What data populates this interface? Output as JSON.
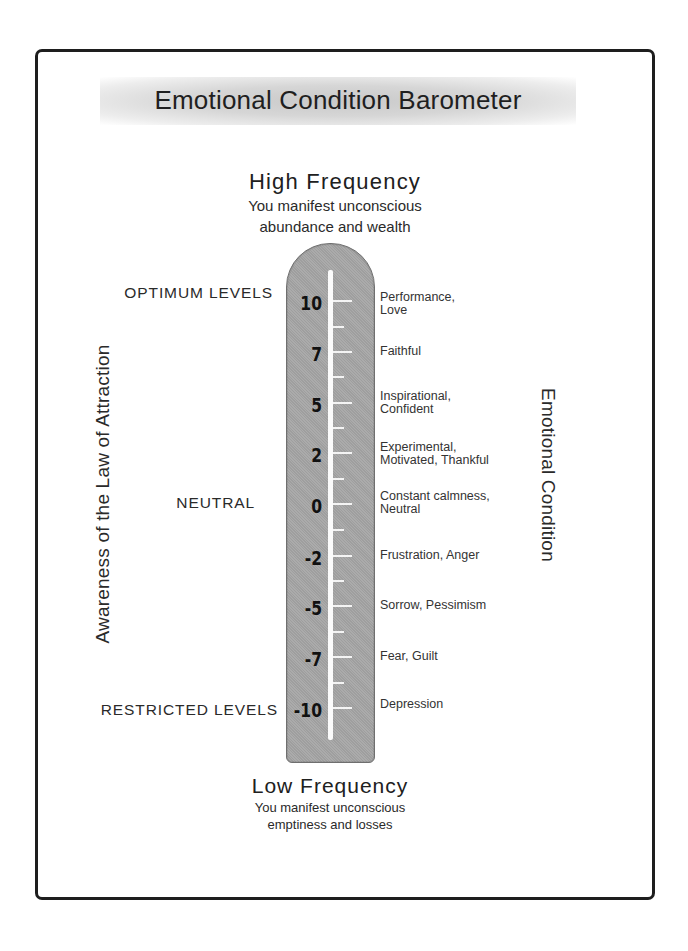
{
  "title": "Emotional Condition Barometer",
  "high": {
    "heading": "High Frequency",
    "line1": "You manifest unconscious",
    "line2": "abundance and wealth"
  },
  "low": {
    "heading": "Low Frequency",
    "line1": "You manifest unconscious",
    "line2": "emptiness and losses"
  },
  "left_axis_label": "Awareness of the Law of Attraction",
  "right_axis_label": "Emotional Condition",
  "zones": {
    "optimum": "OPTIMUM LEVELS",
    "neutral": "NEUTRAL",
    "restricted": "RESTRICTED LEVELS"
  },
  "levels": [
    {
      "value": "10",
      "line1": "Performance,",
      "line2": "Love"
    },
    {
      "value": "7",
      "line1": "Faithful",
      "line2": ""
    },
    {
      "value": "5",
      "line1": "Inspirational,",
      "line2": "Confident"
    },
    {
      "value": "2",
      "line1": "Experimental,",
      "line2": "Motivated, Thankful"
    },
    {
      "value": "0",
      "line1": "Constant calmness,",
      "line2": "Neutral"
    },
    {
      "value": "-2",
      "line1": "Frustration, Anger",
      "line2": ""
    },
    {
      "value": "-5",
      "line1": "Sorrow, Pessimism",
      "line2": ""
    },
    {
      "value": "-7",
      "line1": "Fear, Guilt",
      "line2": ""
    },
    {
      "value": "-10",
      "line1": "Depression",
      "line2": ""
    }
  ],
  "colors": {
    "tube": "#a7a7a7",
    "stem": "#fbfbfb",
    "frame": "#1e1e1e",
    "text": "#2a2a2a"
  }
}
